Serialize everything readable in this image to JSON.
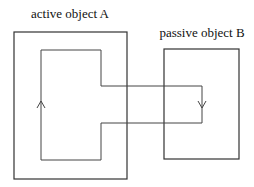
{
  "diagram": {
    "labels": {
      "object_a": "active object A",
      "object_b": "passive object B"
    },
    "nodes": [
      {
        "id": "A",
        "label": "active object A",
        "shape": "rectangle",
        "x": 14,
        "y": 32,
        "w": 113,
        "h": 147
      },
      {
        "id": "B",
        "label": "passive object B",
        "shape": "rectangle",
        "x": 164,
        "y": 49,
        "w": 75,
        "h": 110
      }
    ],
    "path": {
      "description": "closed control-flow loop inside A extending into B",
      "points": [
        [
          41,
          50
        ],
        [
          101,
          50
        ],
        [
          101,
          86
        ],
        [
          202,
          86
        ],
        [
          202,
          123
        ],
        [
          101,
          123
        ],
        [
          101,
          160
        ],
        [
          41,
          160
        ]
      ],
      "arrows": [
        {
          "direction": "up",
          "x": 41,
          "y": 102
        },
        {
          "direction": "down",
          "x": 202,
          "y": 104
        }
      ]
    },
    "colors": {
      "stroke": "#333333",
      "background": "#ffffff"
    }
  }
}
